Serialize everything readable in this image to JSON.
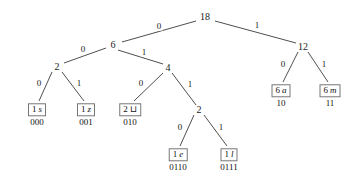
{
  "figure": {
    "background_color": "#ffffff",
    "line_color": "#3a3a3a",
    "box_border_color": "#777777",
    "text_color": "#111111"
  },
  "chart_data": {
    "type": "diagram",
    "diagram_type": "huffman-tree",
    "total_weight": 18,
    "nodes": [
      {
        "id": "root",
        "label": "18",
        "kind": "internal",
        "x": 205,
        "y": 17
      },
      {
        "id": "n6",
        "label": "6",
        "kind": "internal",
        "x": 113,
        "y": 45
      },
      {
        "id": "n12",
        "label": "12",
        "kind": "internal",
        "x": 303,
        "y": 47
      },
      {
        "id": "n2a",
        "label": "2",
        "kind": "internal",
        "x": 57,
        "y": 67
      },
      {
        "id": "n4",
        "label": "4",
        "kind": "internal",
        "x": 168,
        "y": 68
      },
      {
        "id": "n2b",
        "label": "2",
        "kind": "internal",
        "x": 199,
        "y": 110
      }
    ],
    "leaves": [
      {
        "id": "ls",
        "weight": "1",
        "symbol": "s",
        "symbol_name": "letter-s",
        "code": "000",
        "x": 37,
        "y": 110
      },
      {
        "id": "lz",
        "weight": "1",
        "symbol": "z",
        "symbol_name": "letter-z",
        "code": "001",
        "x": 86,
        "y": 110
      },
      {
        "id": "lb",
        "weight": "2",
        "symbol": "⊔",
        "symbol_name": "blank-space",
        "code": "010",
        "x": 130,
        "y": 110
      },
      {
        "id": "le",
        "weight": "1",
        "symbol": "e",
        "symbol_name": "letter-e",
        "code": "0110",
        "x": 178,
        "y": 155
      },
      {
        "id": "ll",
        "weight": "1",
        "symbol": "l",
        "symbol_name": "letter-l",
        "code": "0111",
        "x": 229,
        "y": 155
      },
      {
        "id": "la",
        "weight": "6",
        "symbol": "a",
        "symbol_name": "letter-a",
        "code": "10",
        "x": 281,
        "y": 91
      },
      {
        "id": "lm",
        "weight": "6",
        "symbol": "m",
        "symbol_name": "letter-m",
        "code": "11",
        "x": 330,
        "y": 91
      }
    ],
    "edges": [
      {
        "from": "root",
        "to": "n6",
        "bit": "0",
        "x1": 196,
        "y1": 21,
        "x2": 122,
        "y2": 42,
        "lx": 159,
        "ly": 26
      },
      {
        "from": "root",
        "to": "n12",
        "bit": "1",
        "x1": 215,
        "y1": 21,
        "x2": 296,
        "y2": 43,
        "lx": 257,
        "ly": 25
      },
      {
        "from": "n6",
        "to": "n2a",
        "bit": "0",
        "x1": 106,
        "y1": 48,
        "x2": 64,
        "y2": 63,
        "lx": 83,
        "ly": 49
      },
      {
        "from": "n6",
        "to": "n4",
        "bit": "1",
        "x1": 118,
        "y1": 50,
        "x2": 163,
        "y2": 64,
        "lx": 144,
        "ly": 52
      },
      {
        "from": "n2a",
        "to": "ls",
        "bit": "0",
        "x1": 52,
        "y1": 72,
        "x2": 39,
        "y2": 101,
        "lx": 39,
        "ly": 83
      },
      {
        "from": "n2a",
        "to": "lz",
        "bit": "1",
        "x1": 62,
        "y1": 72,
        "x2": 84,
        "y2": 101,
        "lx": 79,
        "ly": 83
      },
      {
        "from": "n4",
        "to": "lb",
        "bit": "0",
        "x1": 163,
        "y1": 73,
        "x2": 134,
        "y2": 101,
        "lx": 141,
        "ly": 83
      },
      {
        "from": "n4",
        "to": "n2b",
        "bit": "1",
        "x1": 172,
        "y1": 73,
        "x2": 196,
        "y2": 105,
        "lx": 190,
        "ly": 84
      },
      {
        "from": "n2b",
        "to": "le",
        "bit": "0",
        "x1": 194,
        "y1": 115,
        "x2": 180,
        "y2": 146,
        "lx": 180,
        "ly": 127
      },
      {
        "from": "n2b",
        "to": "ll",
        "bit": "1",
        "x1": 204,
        "y1": 115,
        "x2": 227,
        "y2": 146,
        "lx": 221,
        "ly": 127
      },
      {
        "from": "n12",
        "to": "la",
        "bit": "0",
        "x1": 298,
        "y1": 52,
        "x2": 283,
        "y2": 82,
        "lx": 283,
        "ly": 64
      },
      {
        "from": "n12",
        "to": "lm",
        "bit": "1",
        "x1": 308,
        "y1": 52,
        "x2": 328,
        "y2": 82,
        "lx": 324,
        "ly": 64
      }
    ],
    "codes": [
      {
        "symbol": "s",
        "weight": 1,
        "code": "000"
      },
      {
        "symbol": "z",
        "weight": 1,
        "code": "001"
      },
      {
        "symbol": "⊔",
        "weight": 2,
        "code": "010"
      },
      {
        "symbol": "e",
        "weight": 1,
        "code": "0110"
      },
      {
        "symbol": "l",
        "weight": 1,
        "code": "0111"
      },
      {
        "symbol": "a",
        "weight": 6,
        "code": "10"
      },
      {
        "symbol": "m",
        "weight": 6,
        "code": "11"
      }
    ]
  }
}
